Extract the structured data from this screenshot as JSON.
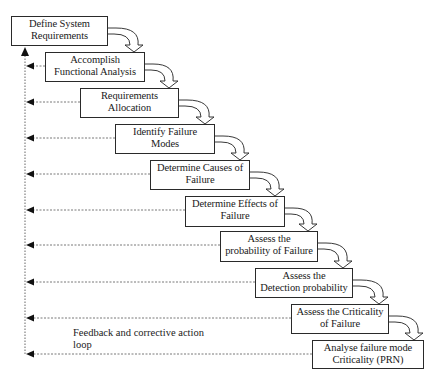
{
  "diagram": {
    "type": "flow-waterfall",
    "steps": [
      {
        "line1": "Define System",
        "line2": "Requirements",
        "x": 11,
        "y": 16,
        "w": 97,
        "h": 30
      },
      {
        "line1": "Accomplish",
        "line2": "Functional Analysis",
        "x": 45,
        "y": 52,
        "w": 100,
        "h": 30
      },
      {
        "line1": "Requirements",
        "line2": "Allocation",
        "x": 80,
        "y": 88,
        "w": 99,
        "h": 30
      },
      {
        "line1": "Identify Failure",
        "line2": "Modes",
        "x": 115,
        "y": 124,
        "w": 100,
        "h": 30
      },
      {
        "line1": "Determine Causes of",
        "line2": "Failure",
        "x": 150,
        "y": 160,
        "w": 100,
        "h": 30
      },
      {
        "line1": "Determine Effects of",
        "line2": "Failure",
        "x": 185,
        "y": 196,
        "w": 100,
        "h": 31
      },
      {
        "line1": "Assess the",
        "line2": "probability of Failure",
        "x": 220,
        "y": 231,
        "w": 98,
        "h": 31
      },
      {
        "line1": "Assess the",
        "line2": "Detection probability",
        "x": 255,
        "y": 268,
        "w": 98,
        "h": 30
      },
      {
        "line1": "Assess the Criticality",
        "line2": "of Failure",
        "x": 291,
        "y": 304,
        "w": 98,
        "h": 30
      },
      {
        "line1": "Analyse failure mode",
        "line2": "Criticality (PRN)",
        "x": 312,
        "y": 340,
        "w": 112,
        "h": 29
      }
    ],
    "feedback_note": {
      "line1": "Feedback and corrective action",
      "line2": "loop"
    },
    "colors": {
      "line": "#2a2a2a",
      "dashed": "#555555",
      "background": "#ffffff"
    }
  }
}
